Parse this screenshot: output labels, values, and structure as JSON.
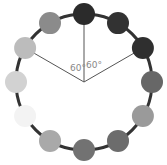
{
  "diagram": {
    "angle_labels": [
      "60°",
      "60°"
    ],
    "dots": [
      {
        "angle": 0,
        "color": "#2b2b2b"
      },
      {
        "angle": 30,
        "color": "#323232"
      },
      {
        "angle": 60,
        "color": "#2f2f2f"
      },
      {
        "angle": 90,
        "color": "#676767"
      },
      {
        "angle": 120,
        "color": "#9a9a9a"
      },
      {
        "angle": 150,
        "color": "#6c6c6c"
      },
      {
        "angle": 180,
        "color": "#727272"
      },
      {
        "angle": 210,
        "color": "#a9a9a9"
      },
      {
        "angle": 240,
        "color": "#f3f3f3"
      },
      {
        "angle": 270,
        "color": "#d2d2d2"
      },
      {
        "angle": 300,
        "color": "#bcbcbc"
      },
      {
        "angle": 330,
        "color": "#8b8b8b"
      }
    ],
    "ring_color": "#333333",
    "spoke_color": "#555555",
    "spoke_angles": [
      0,
      60,
      300
    ]
  }
}
